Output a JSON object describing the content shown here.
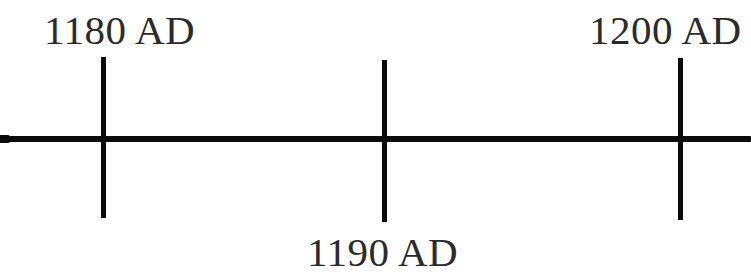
{
  "figure": {
    "kind": "historical-timeline",
    "background_color": "#ffffff",
    "ink_color": "#0b0b0b",
    "text_color": "#2b2b2b",
    "width": 751,
    "height": 277
  },
  "chart_data": {
    "type": "line",
    "title": "",
    "subtitle": "",
    "xlabel": "",
    "ylabel": "",
    "orientation": "horizontal",
    "grid": false,
    "legend": null,
    "axis": {
      "label": "",
      "start_value": 1180,
      "end_value": 1200,
      "unit": "AD",
      "spans_full_width": true,
      "extends_past_left_edge": true,
      "extends_past_right_edge": true
    },
    "categories": [
      "1180 AD",
      "1190 AD",
      "1200 AD"
    ],
    "x": [
      1180,
      1190,
      1200
    ],
    "values": [
      1180,
      1190,
      1200
    ],
    "ticks": [
      {
        "label": "1180 AD",
        "year": 1180,
        "era": "AD",
        "x": 103,
        "label_position": "above",
        "top": 57,
        "bottom": 218
      },
      {
        "label": "1190 AD",
        "year": 1190,
        "era": "AD",
        "x": 384,
        "label_position": "below",
        "top": 60,
        "bottom": 222
      },
      {
        "label": "1200 AD",
        "year": 1200,
        "era": "AD",
        "x": 680,
        "label_position": "above",
        "top": 58,
        "bottom": 220
      }
    ],
    "annotations": []
  },
  "labels": {
    "left": "1180 AD",
    "middle": "1190 AD",
    "right": "1200 AD"
  }
}
